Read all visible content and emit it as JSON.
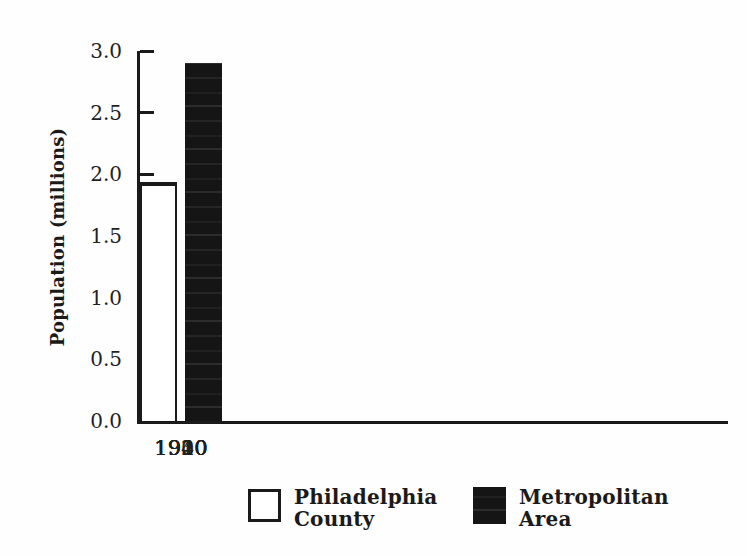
{
  "figure": {
    "background": "#fefefe",
    "ink_color": "#151515",
    "line_color": "#1a1a1a"
  },
  "chart_data": {
    "type": "bar",
    "title": "",
    "xlabel": "",
    "ylabel": "Population (millions)",
    "categories": [
      "1900",
      "1910",
      "1920",
      "1930",
      "1940"
    ],
    "series": [
      {
        "name": "Philadelphia County",
        "color": "#ffffff",
        "values": [
          1.3,
          1.55,
          1.82,
          1.94,
          1.92
        ]
      },
      {
        "name": "Metropolitan Area",
        "color": "#151515",
        "values": [
          null,
          1.98,
          2.4,
          2.85,
          2.9
        ]
      }
    ],
    "ylim": [
      0,
      3.0
    ],
    "yticks": [
      {
        "value": 0.0,
        "label": "0.0"
      },
      {
        "value": 0.5,
        "label": "0.5"
      },
      {
        "value": 1.0,
        "label": "1.0"
      },
      {
        "value": 1.5,
        "label": "1.5"
      },
      {
        "value": 2.0,
        "label": "2.0"
      },
      {
        "value": 2.5,
        "label": "2.5"
      },
      {
        "value": 3.0,
        "label": "3.0"
      }
    ],
    "grid": false,
    "legend_position": "bottom"
  }
}
